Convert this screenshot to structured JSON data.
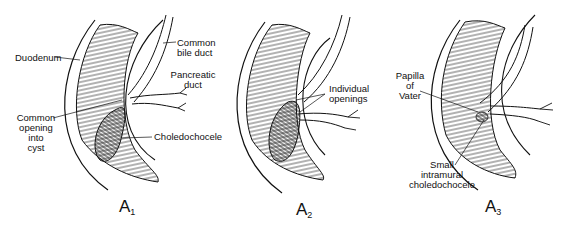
{
  "figure": {
    "panels": [
      {
        "id": "A1",
        "letter": "A",
        "subscript": "1",
        "labels": {
          "duodenum": "Duodenum",
          "common_bile_duct_1": "Common",
          "common_bile_duct_2": "bile duct",
          "pancreatic_duct_1": "Pancreatic",
          "pancreatic_duct_2": "duct",
          "common_opening_1": "Common",
          "common_opening_2": "opening",
          "common_opening_3": "into",
          "common_opening_4": "cyst",
          "choledochocele": "Choledochocele"
        }
      },
      {
        "id": "A2",
        "letter": "A",
        "subscript": "2",
        "labels": {
          "individual_openings_1": "Individual",
          "individual_openings_2": "openings"
        }
      },
      {
        "id": "A3",
        "letter": "A",
        "subscript": "3",
        "labels": {
          "papilla_1": "Papilla",
          "papilla_2": "of",
          "papilla_3": "Vater",
          "small_intramural_1": "Small",
          "small_intramural_2": "intramural",
          "small_intramural_3": "choledochocele"
        }
      }
    ]
  }
}
